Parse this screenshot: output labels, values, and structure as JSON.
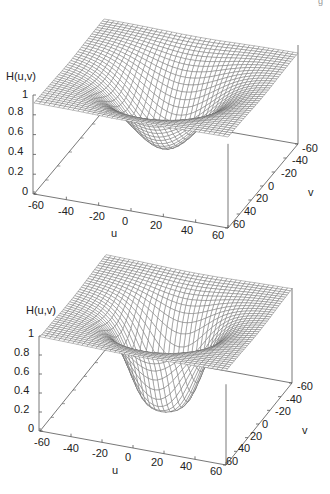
{
  "figure": {
    "corner_mark": "g"
  },
  "chart_data": [
    {
      "type": "surface3d",
      "title": "",
      "zlabel": "H(u,v)",
      "xlabel": "u",
      "ylabel": "v",
      "zlim": [
        0,
        1
      ],
      "xlim": [
        -60,
        60
      ],
      "ylim": [
        -60,
        60
      ],
      "z_ticks": [
        "1",
        "0.8",
        "0.6",
        "0.4",
        "0.2",
        "0"
      ],
      "u_ticks": [
        "-60",
        "-40",
        "-20",
        "0",
        "20",
        "40",
        "60"
      ],
      "v_ticks": [
        "-60",
        "-40",
        "-20",
        "0",
        "20",
        "40",
        "60"
      ],
      "grid": "wireframe mesh 40x40",
      "function": "high-pass, smooth (Gaussian-like): H = 1 - exp(-D^2 / (2*D0^2))",
      "D0": 22,
      "min_value_at_center": 0.22,
      "corner_value": 0.88
    },
    {
      "type": "surface3d",
      "title": "",
      "zlabel": "H(u,v)",
      "xlabel": "u",
      "ylabel": "v",
      "zlim": [
        0,
        1
      ],
      "xlim": [
        -60,
        60
      ],
      "ylim": [
        -60,
        60
      ],
      "z_ticks": [
        "1",
        "0.8",
        "0.6",
        "0.4",
        "0.2",
        "0"
      ],
      "u_ticks": [
        "-60",
        "-40",
        "-20",
        "0",
        "20",
        "40",
        "60"
      ],
      "v_ticks": [
        "-60",
        "-40",
        "-20",
        "0",
        "20",
        "40",
        "60"
      ],
      "grid": "wireframe mesh 40x40",
      "function": "high-pass, sharp (Butterworth-like): H = 1 / (1 + (D0/D)^(2n))",
      "D0": 25,
      "order_n": 2,
      "min_value_at_center": 0.0,
      "corner_value": 1.0
    }
  ]
}
